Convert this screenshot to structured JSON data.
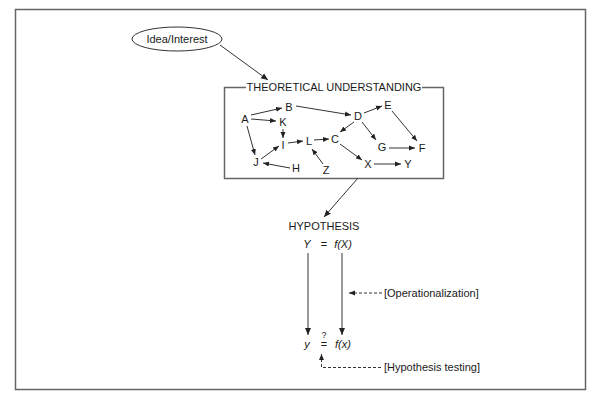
{
  "diagram": {
    "start_node": {
      "label": "Idea/Interest",
      "shape": "ellipse"
    },
    "theory_box": {
      "title": "THEORETICAL UNDERSTANDING",
      "nodes": [
        {
          "id": "A",
          "label": "A"
        },
        {
          "id": "B",
          "label": "B"
        },
        {
          "id": "K",
          "label": "K"
        },
        {
          "id": "I",
          "label": "I"
        },
        {
          "id": "J",
          "label": "J"
        },
        {
          "id": "H",
          "label": "H"
        },
        {
          "id": "L",
          "label": "L"
        },
        {
          "id": "Z",
          "label": "Z"
        },
        {
          "id": "C",
          "label": "C"
        },
        {
          "id": "D",
          "label": "D"
        },
        {
          "id": "E",
          "label": "E"
        },
        {
          "id": "G",
          "label": "G"
        },
        {
          "id": "F",
          "label": "F"
        },
        {
          "id": "X",
          "label": "X"
        },
        {
          "id": "Y",
          "label": "Y"
        }
      ],
      "edges": [
        [
          "A",
          "B"
        ],
        [
          "A",
          "K"
        ],
        [
          "A",
          "J"
        ],
        [
          "K",
          "I"
        ],
        [
          "J",
          "I"
        ],
        [
          "H",
          "J"
        ],
        [
          "I",
          "L"
        ],
        [
          "Z",
          "L"
        ],
        [
          "L",
          "C"
        ],
        [
          "B",
          "D"
        ],
        [
          "D",
          "E"
        ],
        [
          "D",
          "C"
        ],
        [
          "D",
          "G"
        ],
        [
          "E",
          "F"
        ],
        [
          "G",
          "F"
        ],
        [
          "C",
          "X"
        ],
        [
          "X",
          "Y"
        ]
      ]
    },
    "hypothesis": {
      "title": "HYPOTHESIS",
      "theoretical": {
        "lhs": "Y",
        "eq": "=",
        "rhs": "f(X)"
      },
      "empirical": {
        "lhs": "y",
        "eq": "=",
        "question": "?",
        "rhs": "f(x)"
      }
    },
    "annotations": {
      "operationalization": "[Operationalization]",
      "hypothesis_testing": "[Hypothesis testing]"
    }
  }
}
